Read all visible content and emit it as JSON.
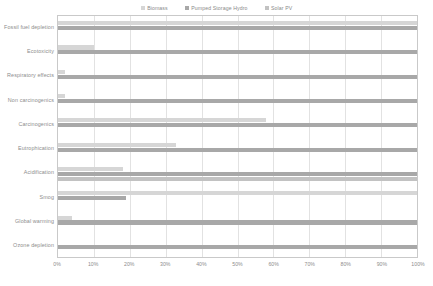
{
  "chart_data": {
    "type": "bar",
    "orientation": "horizontal",
    "grouped": true,
    "title": "",
    "xlabel": "",
    "ylabel": "",
    "xlim": [
      0,
      100
    ],
    "xunit": "%",
    "grid": true,
    "legend_position": "top-center",
    "categories": [
      "Fossil fuel depletion",
      "Ecotoxicity",
      "Respiratory effects",
      "Non carcinogenics",
      "Carcinogenics",
      "Eutrophication",
      "Acidification",
      "Smog",
      "Global warming",
      "Ozone depletion"
    ],
    "xticks": [
      0,
      10,
      20,
      30,
      40,
      50,
      60,
      70,
      80,
      90,
      100
    ],
    "xticklabels": [
      "0%",
      "10%",
      "20%",
      "30%",
      "40%",
      "50%",
      "60%",
      "70%",
      "80%",
      "90%",
      "100%"
    ],
    "series": [
      {
        "name": "Biomass",
        "color": "#d6d6d6",
        "values": [
          100,
          10,
          2,
          2,
          58,
          33,
          18,
          100,
          4,
          0
        ]
      },
      {
        "name": "Pumped Storage Hydro",
        "color": "#a8a8a8",
        "values": [
          100,
          100,
          100,
          100,
          100,
          100,
          100,
          19,
          100,
          100
        ]
      },
      {
        "name": "Solar PV",
        "color": "#c2c2c2",
        "values": [
          0,
          0,
          0,
          0,
          0,
          0,
          100,
          0,
          0,
          0
        ]
      }
    ]
  },
  "legend": {
    "items": [
      {
        "label": "Biomass",
        "color": "#d6d6d6"
      },
      {
        "label": "Pumped Storage Hydro",
        "color": "#a8a8a8"
      },
      {
        "label": "Solar PV",
        "color": "#c2c2c2"
      }
    ]
  },
  "colors": {
    "frame": "#c9c9c9",
    "grid": "#e2e2e2",
    "text": "#8d8d8d",
    "background": "#ffffff"
  }
}
